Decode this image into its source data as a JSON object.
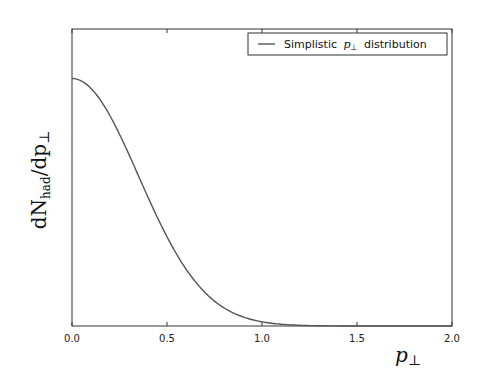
{
  "chart_data": {
    "type": "line",
    "title": "",
    "xlabel": "p⊥",
    "ylabel": "dN_had/dp⊥",
    "xlim": [
      0.0,
      2.0
    ],
    "ylim": [
      0.0,
      1.2
    ],
    "xticks": [
      "0.0",
      "0.5",
      "1.0",
      "1.5",
      "2.0"
    ],
    "yticks": [],
    "grid": false,
    "legend_position": "upper right",
    "series": [
      {
        "name": "Simplistic p⊥ distribution",
        "color": "#555555",
        "function": "gaussian",
        "sigma": 0.35,
        "x": [
          0.0,
          0.1,
          0.2,
          0.3,
          0.4,
          0.5,
          0.6,
          0.7,
          0.8,
          0.9,
          1.0,
          1.1,
          1.2,
          1.4,
          1.6,
          1.8,
          2.0
        ],
        "y": [
          1.0,
          0.96,
          0.85,
          0.69,
          0.52,
          0.36,
          0.23,
          0.14,
          0.07,
          0.04,
          0.017,
          0.007,
          0.003,
          0.0,
          0.0,
          0.0,
          0.0
        ]
      }
    ]
  },
  "labels": {
    "legend": "Simplistic",
    "legend_math": "p",
    "legend_sub": "⊥",
    "legend_rest": "distribution",
    "xlabel_main": "p",
    "xlabel_sub": "⊥",
    "ylabel_d1": "dN",
    "ylabel_sub": "had",
    "ylabel_rest": "/dp",
    "ylabel_perp": "⊥"
  }
}
